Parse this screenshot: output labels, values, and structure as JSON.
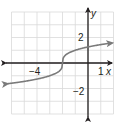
{
  "chart_data": {
    "type": "line",
    "title": "",
    "function": "y = cube_root(x + 2)",
    "xlabel": "x",
    "ylabel": "y",
    "xlim": [
      -6,
      2
    ],
    "ylim": [
      -4,
      4
    ],
    "grid": true,
    "x_tick_labels": [
      {
        "value": -4,
        "label": "−4"
      },
      {
        "value": 1,
        "label": "1"
      }
    ],
    "y_tick_labels": [
      {
        "value": 2,
        "label": "2"
      },
      {
        "value": -2,
        "label": "−2"
      }
    ],
    "series": [
      {
        "name": "curve",
        "x": [
          -6.3,
          -6,
          -5,
          -4,
          -3,
          -2.5,
          -2.1,
          -2,
          -1.9,
          -1.5,
          -1,
          0,
          1,
          1.9
        ],
        "values": [
          -1.63,
          -1.59,
          -1.44,
          -1.26,
          -1.0,
          -0.79,
          -0.46,
          0,
          0.46,
          0.79,
          1.0,
          1.26,
          1.44,
          1.57
        ],
        "arrows": "both"
      }
    ],
    "colors": {
      "curve": "#7a7a7a",
      "axes": "#231f20",
      "grid": "#d9d9d9"
    }
  },
  "labels": {
    "x_axis": "x",
    "y_axis": "y",
    "tick_x_neg4": "−4",
    "tick_x_1": "1",
    "tick_y_2": "2",
    "tick_y_neg2": "−2"
  }
}
